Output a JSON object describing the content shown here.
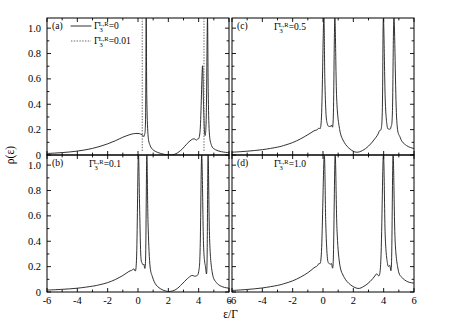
{
  "figure": {
    "ylabel": "ρ(ε)",
    "xlabel": "ε/Γ",
    "yticks": [
      "0",
      "0.2",
      "0.4",
      "0.6",
      "0.8",
      "1.0"
    ],
    "ytick_values": [
      0,
      0.2,
      0.4,
      0.6,
      0.8,
      1.0
    ],
    "xticks": [
      "-6",
      "-4",
      "-2",
      "0",
      "2",
      "4",
      "6"
    ],
    "xtick_values": [
      -6,
      -4,
      -2,
      0,
      2,
      4,
      6
    ],
    "curve_color": "#1a1a1a",
    "dotted_color": "#555555"
  },
  "panels": [
    {
      "tag": "(a)",
      "param_label": "Γ",
      "param_sub": "3",
      "param_sup": "L,R",
      "param_value": "=0",
      "legend": [
        {
          "style": "solid",
          "label_sym": "Γ",
          "sub": "3",
          "sup": "L,R",
          "value": "=0"
        },
        {
          "style": "dotted",
          "label_sym": "Γ",
          "sub": "3",
          "sup": "L,R",
          "value": "=0.01"
        }
      ]
    },
    {
      "tag": "(c)",
      "param_label": "Γ",
      "param_sub": "3",
      "param_sup": "L,R",
      "param_value": "=0.5",
      "legend": []
    },
    {
      "tag": "(b)",
      "param_label": "Γ",
      "param_sub": "3",
      "param_sup": "L,R",
      "param_value": "=0.1",
      "legend": []
    },
    {
      "tag": "(d)",
      "param_label": "Γ",
      "param_sub": "3",
      "param_sup": "L,R",
      "param_value": "=1.0",
      "legend": []
    }
  ],
  "chart_data": {
    "type": "line",
    "title": "",
    "xlabel": "ε/Γ",
    "ylabel": "ρ(ε)",
    "xlim": [
      -6,
      6
    ],
    "ylim": [
      0,
      1.08
    ],
    "grid": false,
    "legend_position": "upper-left-panel-a",
    "subplots": [
      {
        "panel": "(a)",
        "annotation": "Γ3^{L,R}=0",
        "series": [
          {
            "name": "Γ3^{L,R}=0",
            "style": "solid",
            "description": "Broad asymmetric background rising from ~0.01 at ε=-6 to a shoulder ~0.17 at ε=0.2, a very narrow divergent peak at ε≈0.55 reaching above 1.0, a deep dip to 0 at ε≈2.1, a secondary shoulder ~0.12 at ε≈3.6, then two narrow peaks near ε≈4.3 (height ~0.70) and ε≈4.6 (off-scale above 1.0), decaying to ~0.02 at ε=6",
            "x": [
              -6.0,
              -5.5,
              -5.0,
              -4.5,
              -4.0,
              -3.5,
              -3.0,
              -2.5,
              -2.0,
              -1.5,
              -1.0,
              -0.6,
              -0.3,
              0.0,
              0.15,
              0.3,
              0.42,
              0.5,
              0.54,
              0.58,
              0.66,
              0.8,
              1.0,
              1.3,
              1.7,
              2.1,
              2.5,
              2.9,
              3.2,
              3.5,
              3.7,
              3.9,
              4.1,
              4.25,
              4.32,
              4.4,
              4.5,
              4.58,
              4.63,
              4.7,
              4.85,
              5.1,
              5.5,
              6.0
            ],
            "y": [
              0.012,
              0.015,
              0.019,
              0.024,
              0.031,
              0.04,
              0.052,
              0.068,
              0.088,
              0.112,
              0.14,
              0.158,
              0.168,
              0.17,
              0.166,
              0.158,
              0.155,
              0.3,
              1.08,
              0.45,
              0.16,
              0.075,
              0.04,
              0.02,
              0.006,
              0.0,
              0.01,
              0.045,
              0.085,
              0.118,
              0.128,
              0.122,
              0.2,
              0.7,
              0.4,
              0.16,
              0.3,
              1.08,
              0.5,
              0.18,
              0.075,
              0.042,
              0.026,
              0.018
            ]
          },
          {
            "name": "Γ3^{L,R}=0.01",
            "style": "dotted",
            "description": "Nearly identical background with an extremely sharp vertical resonance line at ε≈0.28 and another at ε≈4.35, both extending off the top of the axis",
            "vertical_lines": [
              0.28,
              4.35
            ]
          }
        ]
      },
      {
        "panel": "(c)",
        "annotation": "Γ3^{L,R}=0.5",
        "series": [
          {
            "name": "Γ3^{L,R}=0.5",
            "style": "solid",
            "description": "Smooth background rising from ~0.02 at ε=-6 to ~0.22 near ε=0, then a split doublet: two tall off-scale peaks at ε≈0.15 and ε≈0.75 with a narrow valley down to ~0.22 between them; dip to ~0.02 at ε≈2.2; rising to a second doublet with off-scale peaks at ε≈4.0 and ε≈4.6 and a valley ~0.20 between; falls to ~0.05 by ε=6",
            "x": [
              -6.0,
              -5.0,
              -4.0,
              -3.0,
              -2.5,
              -2.0,
              -1.5,
              -1.0,
              -0.6,
              -0.3,
              -0.1,
              0.05,
              0.12,
              0.2,
              0.3,
              0.42,
              0.55,
              0.68,
              0.78,
              0.9,
              1.1,
              1.4,
              1.8,
              2.2,
              2.6,
              3.0,
              3.4,
              3.7,
              3.9,
              3.98,
              4.1,
              4.22,
              4.35,
              4.48,
              4.58,
              4.68,
              4.85,
              5.1,
              5.5,
              6.0
            ],
            "y": [
              0.022,
              0.03,
              0.042,
              0.062,
              0.078,
              0.098,
              0.126,
              0.16,
              0.19,
              0.21,
              0.3,
              1.08,
              0.6,
              0.32,
              0.24,
              0.225,
              0.235,
              0.3,
              1.08,
              0.45,
              0.2,
              0.1,
              0.045,
              0.022,
              0.035,
              0.07,
              0.125,
              0.185,
              0.3,
              1.08,
              0.45,
              0.235,
              0.205,
              0.22,
              0.35,
              1.08,
              0.3,
              0.135,
              0.075,
              0.05
            ]
          }
        ]
      },
      {
        "panel": "(b)",
        "annotation": "Γ3^{L,R}=0.1",
        "series": [
          {
            "name": "Γ3^{L,R}=0.1",
            "style": "solid",
            "description": "Background rising from ~0.015 at ε=-6 to ~0.19 near ε=-0.1, then a narrow doublet with off-scale peaks at ε≈0.12 and ε≈0.62 separated by a narrow valley dropping to ~0.22; deep dip to ~0.005 at ε≈2.1; shoulder ~0.13 near ε≈3.6; second narrow doublet with off-scale peaks at ε≈4.15 and ε≈4.65; decays to ~0.03 at ε=6",
            "x": [
              -6.0,
              -5.0,
              -4.0,
              -3.0,
              -2.5,
              -2.0,
              -1.5,
              -1.0,
              -0.6,
              -0.3,
              -0.1,
              0.02,
              0.1,
              0.18,
              0.28,
              0.38,
              0.5,
              0.58,
              0.66,
              0.78,
              0.95,
              1.2,
              1.6,
              2.05,
              2.5,
              2.9,
              3.25,
              3.55,
              3.8,
              4.0,
              4.1,
              4.2,
              4.32,
              4.45,
              4.55,
              4.62,
              4.72,
              4.9,
              5.2,
              5.6,
              6.0
            ],
            "y": [
              0.015,
              0.021,
              0.03,
              0.046,
              0.058,
              0.074,
              0.098,
              0.13,
              0.162,
              0.182,
              0.25,
              1.08,
              0.7,
              0.3,
              0.225,
              0.22,
              0.26,
              1.08,
              0.55,
              0.22,
              0.12,
              0.055,
              0.018,
              0.004,
              0.02,
              0.062,
              0.105,
              0.13,
              0.125,
              0.16,
              0.35,
              1.08,
              0.38,
              0.2,
              0.22,
              1.08,
              0.42,
              0.15,
              0.07,
              0.04,
              0.03
            ]
          }
        ]
      },
      {
        "panel": "(d)",
        "annotation": "Γ3^{L,R}=1.0",
        "series": [
          {
            "name": "Γ3^{L,R}=1.0",
            "style": "solid",
            "description": "Background rising from ~0.01 at ε=-6 to ~0.25 near ε=-0.05, then a doublet with off-scale peaks at ε≈0.2 and ε≈0.8 and a valley ~0.22 between; dip to ~0.03 at ε≈2.3; rises to a second doublet with off-scale peaks at ε≈4.05 and ε≈4.65 with a valley ~0.21; decreases to ~0.07 at ε=6",
            "x": [
              -6.0,
              -5.0,
              -4.0,
              -3.0,
              -2.5,
              -2.0,
              -1.5,
              -1.0,
              -0.6,
              -0.3,
              -0.1,
              0.08,
              0.18,
              0.28,
              0.4,
              0.55,
              0.68,
              0.8,
              0.92,
              1.1,
              1.4,
              1.8,
              2.3,
              2.7,
              3.1,
              3.5,
              3.8,
              3.98,
              4.1,
              4.25,
              4.4,
              4.52,
              4.62,
              4.75,
              4.95,
              5.2,
              5.6,
              6.0
            ],
            "y": [
              0.012,
              0.02,
              0.032,
              0.052,
              0.068,
              0.088,
              0.116,
              0.152,
              0.19,
              0.22,
              0.32,
              1.08,
              0.55,
              0.28,
              0.225,
              0.225,
              0.26,
              1.08,
              0.5,
              0.22,
              0.115,
              0.058,
              0.028,
              0.045,
              0.082,
              0.14,
              0.215,
              1.08,
              0.45,
              0.225,
              0.21,
              0.24,
              1.08,
              0.42,
              0.18,
              0.115,
              0.08,
              0.07
            ]
          }
        ]
      }
    ]
  }
}
